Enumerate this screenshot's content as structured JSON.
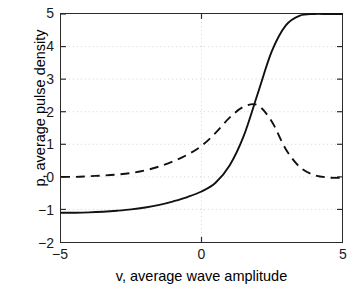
{
  "chart_data": {
    "type": "line",
    "title": "",
    "xlabel": "v, average wave amplitude",
    "ylabel": "p, average pulse density",
    "xlim": [
      -5,
      5
    ],
    "ylim": [
      -2,
      5
    ],
    "xticks": [
      -5,
      0,
      5
    ],
    "xtick_labels": [
      "-5",
      "0",
      "5"
    ],
    "yticks": [
      -2,
      -1,
      0,
      1,
      2,
      3,
      4,
      5
    ],
    "ytick_labels": [
      "-2",
      "-1",
      "0",
      "1",
      "2",
      "3",
      "4",
      "5"
    ],
    "grid": true,
    "legend": "none",
    "x": [
      -5,
      -4.5,
      -4,
      -3.5,
      -3,
      -2.5,
      -2,
      -1.5,
      -1,
      -0.5,
      0,
      0.5,
      1,
      1.5,
      2,
      2.5,
      3,
      3.5,
      4,
      4.5,
      5
    ],
    "series": [
      {
        "name": "average pulse density",
        "style": "solid",
        "color": "#111111",
        "values": [
          -1.1,
          -1.1,
          -1.09,
          -1.07,
          -1.04,
          -1.0,
          -0.94,
          -0.86,
          -0.75,
          -0.62,
          -0.45,
          -0.18,
          0.35,
          1.25,
          2.55,
          3.85,
          4.65,
          4.95,
          5.0,
          5.0,
          5.0
        ]
      },
      {
        "name": "derivative of pulse density",
        "style": "dashed",
        "color": "#111111",
        "values": [
          0.0,
          0.0,
          0.02,
          0.04,
          0.07,
          0.12,
          0.2,
          0.32,
          0.48,
          0.68,
          0.95,
          1.35,
          1.82,
          2.15,
          2.2,
          1.7,
          0.85,
          0.3,
          0.06,
          -0.02,
          -0.03
        ]
      }
    ]
  }
}
